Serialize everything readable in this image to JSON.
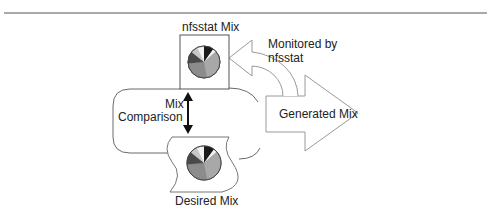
{
  "diagram": {
    "nodes": {
      "nfsstat_mix": {
        "label": "nfsstat Mix"
      },
      "desired_mix": {
        "label": "Desired Mix"
      },
      "generated_mix": {
        "label": "Generated Mix"
      }
    },
    "edges": {
      "monitored": {
        "label_line1": "Monitored by",
        "label_line2": "nfsstat"
      },
      "comparison": {
        "label_line1": "Mix",
        "label_line2": "Comparison"
      }
    },
    "colors": {
      "line": "#8a8a8a",
      "pie_black": "#1a1a1a",
      "pie_white": "#f2f2f2",
      "pie_light": "#c8c8c8",
      "pie_dark": "#4a4a4a",
      "pie_mid": "#8c8c8c",
      "pie_light2": "#a8a8a8"
    }
  }
}
